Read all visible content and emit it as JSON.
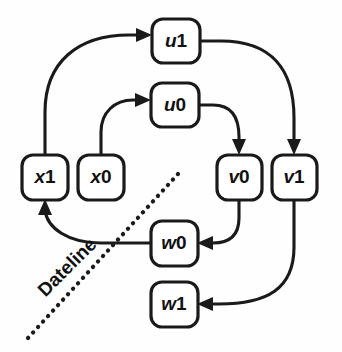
{
  "diagram": {
    "background_color": "#fefefe",
    "stroke_color": "#1a1a1a",
    "node_fill": "#ffffff",
    "nodes": [
      {
        "id": "u1",
        "label_var": "u",
        "label_num": "1",
        "cx": 176,
        "cy": 41,
        "w": 48,
        "h": 44
      },
      {
        "id": "u0",
        "label_var": "u",
        "label_num": "0",
        "cx": 175,
        "cy": 105,
        "w": 48,
        "h": 44
      },
      {
        "id": "x1",
        "label_var": "x",
        "label_num": "1",
        "cx": 45,
        "cy": 177,
        "w": 46,
        "h": 45
      },
      {
        "id": "x0",
        "label_var": "x",
        "label_num": "0",
        "cx": 101,
        "cy": 177,
        "w": 46,
        "h": 45
      },
      {
        "id": "v0",
        "label_var": "v",
        "label_num": "0",
        "cx": 239,
        "cy": 177,
        "w": 45,
        "h": 45
      },
      {
        "id": "v1",
        "label_var": "v",
        "label_num": "1",
        "cx": 294,
        "cy": 177,
        "w": 45,
        "h": 45
      },
      {
        "id": "w0",
        "label_var": "w",
        "label_num": "0",
        "cx": 174,
        "cy": 243,
        "w": 47,
        "h": 45
      },
      {
        "id": "w1",
        "label_var": "w",
        "label_num": "1",
        "cx": 174,
        "cy": 304,
        "w": 47,
        "h": 45
      }
    ],
    "edges": [
      {
        "id": "x1-to-u1",
        "from": "x1",
        "to": "u1"
      },
      {
        "id": "x0-to-u0",
        "from": "x0",
        "to": "u0"
      },
      {
        "id": "u1-to-v1",
        "from": "u1",
        "to": "v1"
      },
      {
        "id": "u0-to-v0",
        "from": "u0",
        "to": "v0"
      },
      {
        "id": "v0-to-w0",
        "from": "v0",
        "to": "w0"
      },
      {
        "id": "v1-to-w1",
        "from": "v1",
        "to": "w1"
      },
      {
        "id": "w0-to-x1",
        "from": "w0",
        "to": "x1"
      }
    ],
    "dateline": {
      "label": "Dateline",
      "rotation_deg": -45,
      "x1": 178,
      "y1": 174,
      "x2": 28,
      "y2": 338,
      "label_cx": 68,
      "label_cy": 268
    }
  }
}
